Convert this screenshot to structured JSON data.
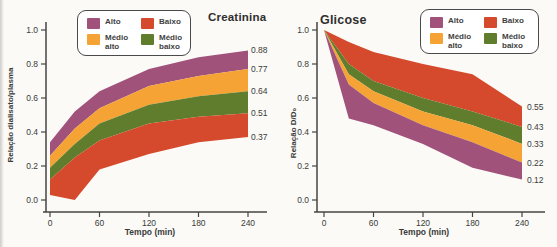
{
  "page": {
    "background": "#fbfaf6"
  },
  "colors": {
    "alto": "#a0527b",
    "baixo": "#d5492c",
    "medio_alto": "#f4a334",
    "medio_baixo": "#5f7d2c",
    "axis": "#454545",
    "text": "#3a3a3a"
  },
  "chart_data": [
    {
      "type": "area",
      "title": "Creatinina",
      "xlabel": "Tempo (min)",
      "ylabel": "Relação dialisato/plasma",
      "x": [
        0,
        30,
        60,
        120,
        180,
        240
      ],
      "xticks": [
        "0",
        "60",
        "120",
        "180",
        "240"
      ],
      "yticks": [
        "0.0",
        "0.2",
        "0.4",
        "0.6",
        "0.8",
        "1.0"
      ],
      "xlim": [
        0,
        240
      ],
      "ylim": [
        0,
        1.0
      ],
      "legend": {
        "position": "top-center",
        "items": [
          {
            "label": "Alto",
            "color": "#a0527b"
          },
          {
            "label": "Baixo",
            "color": "#d5492c"
          },
          {
            "label": "Médio alto",
            "color": "#f4a334"
          },
          {
            "label": "Médio baixo",
            "color": "#5f7d2c"
          }
        ]
      },
      "boundaries": [
        {
          "name": "alto-top",
          "values": [
            0.34,
            0.52,
            0.64,
            0.77,
            0.84,
            0.88
          ]
        },
        {
          "name": "alto-medio_alto",
          "values": [
            0.26,
            0.42,
            0.54,
            0.67,
            0.73,
            0.77
          ]
        },
        {
          "name": "medio_alto-medio_baixo",
          "values": [
            0.19,
            0.33,
            0.45,
            0.56,
            0.61,
            0.64
          ]
        },
        {
          "name": "medio_baixo-baixo",
          "values": [
            0.12,
            0.25,
            0.35,
            0.45,
            0.49,
            0.51
          ]
        },
        {
          "name": "baixo-bottom",
          "values": [
            0.03,
            0.0,
            0.18,
            0.27,
            0.34,
            0.37
          ]
        }
      ],
      "bands": [
        {
          "name": "Alto",
          "color": "#a0527b"
        },
        {
          "name": "Médio alto",
          "color": "#f4a334"
        },
        {
          "name": "Médio baixo",
          "color": "#5f7d2c"
        },
        {
          "name": "Baixo",
          "color": "#d5492c"
        }
      ],
      "end_labels": [
        "0.88",
        "0.77",
        "0.64",
        "0.51",
        "0.37"
      ]
    },
    {
      "type": "area",
      "title": "Glicose",
      "xlabel": "Tempo (min)",
      "ylabel": "Relação D/D₀",
      "x": [
        0,
        30,
        60,
        120,
        180,
        240
      ],
      "xticks": [
        "0",
        "60",
        "120",
        "180",
        "240"
      ],
      "yticks": [
        "0.0",
        "0.2",
        "0.4",
        "0.6",
        "0.8",
        "1.0"
      ],
      "xlim": [
        0,
        240
      ],
      "ylim": [
        0,
        1.0
      ],
      "legend": {
        "position": "top-right",
        "items": [
          {
            "label": "Alto",
            "color": "#a0527b"
          },
          {
            "label": "Baixo",
            "color": "#d5492c"
          },
          {
            "label": "Médio alto",
            "color": "#f4a334"
          },
          {
            "label": "Médio baixo",
            "color": "#5f7d2c"
          }
        ]
      },
      "boundaries": [
        {
          "name": "baixo-top",
          "values": [
            1.0,
            0.93,
            0.87,
            0.8,
            0.74,
            0.55
          ]
        },
        {
          "name": "baixo-medio_baixo",
          "values": [
            1.0,
            0.8,
            0.7,
            0.6,
            0.52,
            0.43
          ]
        },
        {
          "name": "medio_baixo-medio_alto",
          "values": [
            1.0,
            0.74,
            0.64,
            0.52,
            0.44,
            0.33
          ]
        },
        {
          "name": "medio_alto-alto",
          "values": [
            1.0,
            0.68,
            0.57,
            0.44,
            0.34,
            0.22
          ]
        },
        {
          "name": "alto-bottom",
          "values": [
            1.0,
            0.48,
            0.44,
            0.33,
            0.19,
            0.12
          ]
        }
      ],
      "bands": [
        {
          "name": "Baixo",
          "color": "#d5492c"
        },
        {
          "name": "Médio baixo",
          "color": "#5f7d2c"
        },
        {
          "name": "Médio alto",
          "color": "#f4a334"
        },
        {
          "name": "Alto",
          "color": "#a0527b"
        }
      ],
      "end_labels": [
        "0.55",
        "0.43",
        "0.33",
        "0.22",
        "0.12"
      ]
    }
  ]
}
